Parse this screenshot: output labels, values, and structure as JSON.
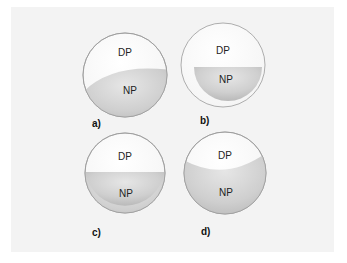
{
  "diagram": {
    "panels": [
      {
        "id": "a",
        "caption": "a)",
        "top_label": "DP",
        "bottom_label": "NP",
        "description": "NP occupies lower portion with a tilted curved interface"
      },
      {
        "id": "b",
        "caption": "b)",
        "top_label": "DP",
        "bottom_label": "NP",
        "description": "NP as a semicircular lens inside the sphere, detached from the shell"
      },
      {
        "id": "c",
        "caption": "c)",
        "top_label": "DP",
        "bottom_label": "NP",
        "description": "Flat horizontal interface, NP fills lower ~2/3"
      },
      {
        "id": "d",
        "caption": "d)",
        "top_label": "DP",
        "bottom_label": "NP",
        "description": "Concave interface, NP fills most of the sphere"
      }
    ],
    "colors": {
      "background": "#ffffff",
      "panel_fill": "#f3f3f3",
      "dp_fill": "#ffffff",
      "np_fill_light": "#e8e8e8",
      "np_fill_dark": "#b8b8b8",
      "outline": "#9a9a9a"
    }
  }
}
